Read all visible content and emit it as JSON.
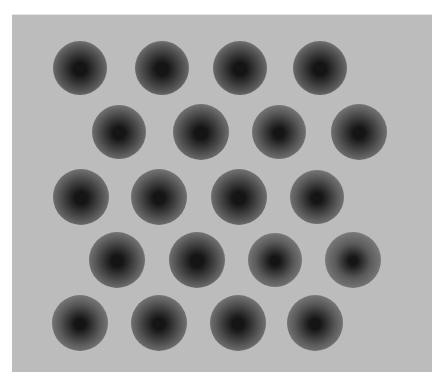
{
  "image": {
    "description": "Grayscale image of a staggered grid of circular dark spots on a light gray background",
    "background_color": "#ffffff",
    "panel_color": "#bcbcbc",
    "spot_outer_color": "#8a8a8a",
    "spot_mid_color": "#5a5a5a",
    "spot_core_color": "#151515"
  },
  "spots": [
    {
      "row": 1,
      "x": 80,
      "y": 67,
      "r": 27,
      "core": 0.45
    },
    {
      "row": 1,
      "x": 162,
      "y": 67,
      "r": 27,
      "core": 0.45
    },
    {
      "row": 1,
      "x": 240,
      "y": 67,
      "r": 27,
      "core": 0.45
    },
    {
      "row": 1,
      "x": 320,
      "y": 67,
      "r": 27,
      "core": 0.45
    },
    {
      "row": 2,
      "x": 119,
      "y": 131,
      "r": 27,
      "core": 0.42
    },
    {
      "row": 2,
      "x": 201,
      "y": 131,
      "r": 28,
      "core": 0.42
    },
    {
      "row": 2,
      "x": 279,
      "y": 131,
      "r": 27,
      "core": 0.38
    },
    {
      "row": 2,
      "x": 359,
      "y": 131,
      "r": 28,
      "core": 0.4
    },
    {
      "row": 3,
      "x": 81,
      "y": 196,
      "r": 28,
      "core": 0.42
    },
    {
      "row": 3,
      "x": 159,
      "y": 196,
      "r": 28,
      "core": 0.4
    },
    {
      "row": 3,
      "x": 239,
      "y": 196,
      "r": 28,
      "core": 0.42
    },
    {
      "row": 3,
      "x": 317,
      "y": 196,
      "r": 27,
      "core": 0.38
    },
    {
      "row": 4,
      "x": 117,
      "y": 259,
      "r": 28,
      "core": 0.4
    },
    {
      "row": 4,
      "x": 197,
      "y": 259,
      "r": 28,
      "core": 0.42
    },
    {
      "row": 4,
      "x": 275,
      "y": 259,
      "r": 27,
      "core": 0.34
    },
    {
      "row": 4,
      "x": 353,
      "y": 259,
      "r": 28,
      "core": 0.28
    },
    {
      "row": 5,
      "x": 80,
      "y": 322,
      "r": 28,
      "core": 0.36
    },
    {
      "row": 5,
      "x": 159,
      "y": 322,
      "r": 28,
      "core": 0.4
    },
    {
      "row": 5,
      "x": 238,
      "y": 322,
      "r": 28,
      "core": 0.4
    },
    {
      "row": 5,
      "x": 315,
      "y": 322,
      "r": 28,
      "core": 0.36
    }
  ]
}
